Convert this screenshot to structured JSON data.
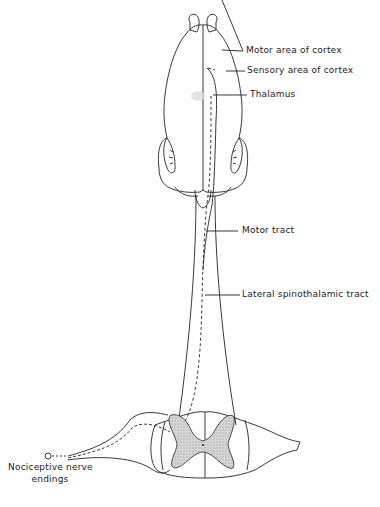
{
  "diagram": {
    "labels": {
      "motor_area": "Motor area of cortex",
      "sensory_area": "Sensory area of cortex",
      "thalamus": "Thalamus",
      "motor_tract": "Motor tract",
      "lateral_spinothalamic_tract": "Lateral spinothalamic tract",
      "nociceptive_line1": "Nociceptive nerve",
      "nociceptive_line2": "endings"
    },
    "colors": {
      "line": "#222222",
      "grey_matter": "#cfcfcf",
      "thalamus_highlight": "#dddddd"
    }
  }
}
